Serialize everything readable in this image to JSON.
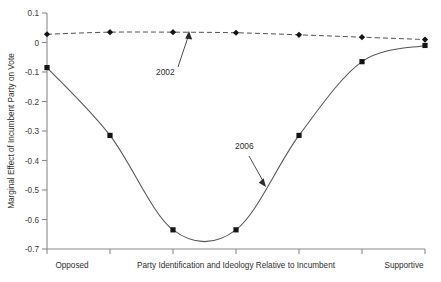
{
  "chart_data": {
    "type": "line",
    "title": "",
    "xlabel": "Party Identification and Ideology Relative to Incumbent",
    "ylabel": "Marginal Effect of Incumbent Party on Vote",
    "x": [
      0,
      1,
      2,
      3,
      4,
      5,
      6
    ],
    "xlim": [
      0,
      6
    ],
    "ylim": [
      -0.7,
      0.1
    ],
    "yticks": [
      0.1,
      0,
      -0.1,
      -0.2,
      -0.3,
      -0.4,
      -0.5,
      -0.6,
      -0.7
    ],
    "ytick_labels": [
      "0.1",
      "0",
      "-0.1",
      "-0.2",
      "-0.3",
      "-0.4",
      "-0.5",
      "-0.6",
      "-0.7"
    ],
    "xtick_labels": [
      "",
      "",
      "",
      "",
      "",
      "",
      ""
    ],
    "x_left_category": "Opposed",
    "x_right_category": "Supportive",
    "grid": false,
    "legend": "annotations",
    "series": [
      {
        "name": "2002",
        "style": "dashed",
        "marker": "diamond",
        "values": [
          0.028,
          0.035,
          0.035,
          0.033,
          0.026,
          0.018,
          0.01
        ]
      },
      {
        "name": "2006",
        "style": "solid",
        "marker": "square",
        "values": [
          -0.085,
          -0.315,
          -0.635,
          -0.635,
          -0.315,
          -0.065,
          -0.01
        ]
      }
    ],
    "annotations": [
      {
        "text": "2002",
        "series": "2002",
        "label_x": 170,
        "label_y": 72,
        "arrow_to_x": 187,
        "arrow_to_y": 33
      },
      {
        "text": "2006",
        "series": "2006",
        "label_x": 249,
        "label_y": 146,
        "arrow_to_x": 266,
        "arrow_to_y": 186
      }
    ]
  },
  "axes": {
    "y_title": "Marginal Effect of Incumbent Party on Vote",
    "x_title": "Party Identification and Ideology Relative to Incumbent",
    "x_left": "Opposed",
    "x_right": "Supportive",
    "y_labels": {
      "t0": "0.1",
      "t1": "0",
      "t2": "-0.1",
      "t3": "-0.2",
      "t4": "-0.3",
      "t5": "-0.4",
      "t6": "-0.5",
      "t7": "-0.6",
      "t8": "-0.7"
    }
  },
  "annotations": {
    "a2002": "2002",
    "a2006": "2006"
  },
  "colors": {
    "axis": "#8a8a8a",
    "line_2006": "#555555",
    "line_2002": "#4a4a4a",
    "marker": "#141414",
    "text": "#2e2e2e",
    "background": "#ffffff"
  }
}
